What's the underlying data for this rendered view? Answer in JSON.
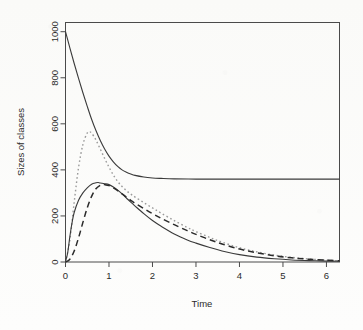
{
  "chart_data": {
    "type": "line",
    "title": "",
    "xlabel": "Time",
    "ylabel": "Sizes of classes",
    "xlim": [
      0,
      6.3
    ],
    "ylim": [
      0,
      1040
    ],
    "xticks": [
      0,
      1,
      2,
      3,
      4,
      5,
      6
    ],
    "xtick_labels": [
      "0",
      "1",
      "2",
      "3",
      "4",
      "5",
      "6"
    ],
    "yticks": [
      0,
      200,
      400,
      600,
      800,
      1000
    ],
    "ytick_labels": [
      "0",
      "200",
      "400",
      "600",
      "800",
      "1000"
    ],
    "grid": false,
    "legend": "none",
    "box": "full",
    "series": [
      {
        "name": "susceptible",
        "style": "solid",
        "color": "#3a3a3a",
        "x": [
          0,
          0.1,
          0.2,
          0.3,
          0.4,
          0.5,
          0.6,
          0.7,
          0.8,
          0.9,
          1.0,
          1.1,
          1.2,
          1.3,
          1.4,
          1.5,
          1.6,
          1.8,
          2.0,
          2.2,
          2.5,
          3.0,
          3.5,
          4.0,
          4.5,
          5.0,
          5.5,
          6.0,
          6.3
        ],
        "values": [
          1000,
          930,
          862,
          797,
          735,
          676,
          620,
          571,
          528,
          491,
          460,
          435,
          415,
          400,
          390,
          382,
          376,
          369,
          365,
          363,
          361,
          360,
          360,
          360,
          360,
          360,
          360,
          360,
          360
        ]
      },
      {
        "name": "exposed",
        "style": "dotted",
        "color": "#9a9a9a",
        "x": [
          0,
          0.1,
          0.2,
          0.3,
          0.4,
          0.5,
          0.55,
          0.6,
          0.7,
          0.8,
          0.9,
          1.0,
          1.1,
          1.2,
          1.3,
          1.4,
          1.5,
          1.6,
          1.8,
          2.0,
          2.2,
          2.5,
          2.8,
          3.0,
          3.3,
          3.6,
          4.0,
          4.4,
          4.8,
          5.2,
          5.6,
          6.0,
          6.3
        ],
        "values": [
          0,
          95,
          260,
          410,
          510,
          560,
          565,
          560,
          530,
          490,
          450,
          412,
          378,
          350,
          328,
          310,
          295,
          282,
          258,
          235,
          212,
          180,
          150,
          132,
          108,
          86,
          62,
          44,
          30,
          20,
          13,
          8,
          5
        ]
      },
      {
        "name": "infectious",
        "style": "solid",
        "color": "#3a3a3a",
        "x": [
          0,
          0.05,
          0.1,
          0.15,
          0.2,
          0.3,
          0.4,
          0.5,
          0.6,
          0.7,
          0.75,
          0.8,
          0.9,
          1.0,
          1.1,
          1.2,
          1.3,
          1.4,
          1.5,
          1.6,
          1.8,
          2.0,
          2.2,
          2.5,
          2.8,
          3.0,
          3.3,
          3.6,
          4.0,
          4.4,
          4.8,
          5.2,
          5.6,
          6.0,
          6.3
        ],
        "values": [
          2,
          40,
          110,
          170,
          215,
          268,
          300,
          322,
          338,
          344,
          345,
          343,
          340,
          336,
          326,
          312,
          296,
          278,
          260,
          243,
          210,
          180,
          155,
          122,
          96,
          82,
          64,
          48,
          32,
          21,
          14,
          9,
          6,
          4,
          3
        ]
      },
      {
        "name": "removed",
        "style": "dashed",
        "color": "#2a2a2a",
        "x": [
          0,
          0.1,
          0.2,
          0.3,
          0.4,
          0.5,
          0.6,
          0.7,
          0.8,
          0.85,
          0.9,
          1.0,
          1.1,
          1.2,
          1.3,
          1.4,
          1.5,
          1.6,
          1.8,
          2.0,
          2.2,
          2.5,
          2.8,
          3.0,
          3.3,
          3.6,
          4.0,
          4.4,
          4.8,
          5.2,
          5.6,
          6.0,
          6.3
        ],
        "values": [
          0,
          12,
          48,
          105,
          172,
          235,
          285,
          318,
          333,
          336,
          336,
          332,
          322,
          310,
          296,
          282,
          268,
          255,
          232,
          210,
          190,
          162,
          136,
          120,
          98,
          78,
          56,
          40,
          27,
          18,
          12,
          8,
          5
        ]
      }
    ]
  },
  "axes": {
    "x_title": "Time",
    "y_title": "Sizes of classes"
  }
}
